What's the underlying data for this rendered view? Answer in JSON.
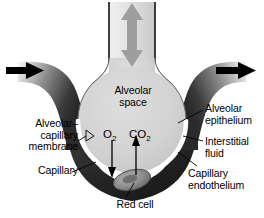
{
  "figure": {
    "background_color": "#ffffff"
  },
  "colors": {
    "alveolar_space": "#d2d2d2",
    "capillary_wall": "#2b2b2b",
    "basement_membrane": "#ffffff",
    "airway_gradient_light": "#f2f2f2",
    "airway_gradient_dark": "#9a9a9a",
    "vessel_gradient_light": "#ffffff",
    "vessel_gradient_dark": "#1c1c1c",
    "ventilation_arrow": "#9e9e9e",
    "blood_flow_arrow": "#000000",
    "red_cell_fill": "#8f8f8f",
    "leader_line": "#000000",
    "text": "#000000"
  },
  "labels": {
    "alveolar_space": "Alveolar\nspace",
    "alveolar_capillary_membrane": "Alveolar–\ncapillary\nmembrane",
    "capillary": "Capillary",
    "alveolar_epithelium": "Alveolar\nepithelium",
    "interstitial_fluid": "Interstitial\nfluid",
    "capillary_endothelium": "Capillary\nendothelium",
    "red_cell": "Red cell",
    "oxygen_symbol": "O",
    "oxygen_subscript": "2",
    "carbon_dioxide_symbol": "CO",
    "carbon_dioxide_subscript": "2"
  },
  "arrows": {
    "ventilation": {
      "name": "bidirectional-ventilation-arrow",
      "direction": "up-down",
      "color": "#9e9e9e"
    },
    "blood_inflow": {
      "name": "blood-inflow-arrow",
      "direction": "right",
      "color": "#000000"
    },
    "blood_outflow": {
      "name": "blood-outflow-arrow",
      "direction": "right",
      "color": "#000000"
    },
    "oxygen_diffusion": {
      "name": "oxygen-diffusion-arrow",
      "direction": "down",
      "color": "#000000"
    },
    "carbon_dioxide_diffusion": {
      "name": "carbon-dioxide-diffusion-arrow",
      "direction": "up",
      "color": "#000000"
    }
  }
}
